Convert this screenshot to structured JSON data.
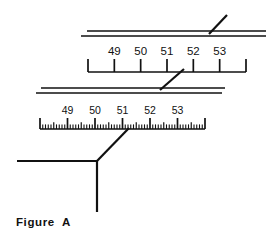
{
  "figure": {
    "caption": "Figure  A",
    "title": "Figure A",
    "ink_color": "#111111",
    "background_color": "#ffffff"
  },
  "chart_data": {
    "type": "diagram",
    "title": "Figure A",
    "xlabel": "",
    "ylabel": "",
    "scales": [
      {
        "name": "top-scale",
        "role": "coarse",
        "tick_labels": [
          "49",
          "50",
          "51",
          "52",
          "53"
        ],
        "tick_count": 7,
        "labeled_tick_indices": [
          1,
          2,
          3,
          4,
          5
        ],
        "minor_divisions": 0,
        "x_start": 88,
        "x_end": 246,
        "baseline_y": 72,
        "tick_height": 13
      },
      {
        "name": "bottom-scale",
        "role": "fine",
        "tick_labels": [
          "49",
          "50",
          "51",
          "52",
          "53"
        ],
        "tick_count": 7,
        "labeled_tick_indices": [
          1,
          2,
          3,
          4,
          5
        ],
        "minor_divisions": 10,
        "x_start": 40,
        "x_end": 205,
        "baseline_y": 129,
        "tick_height": 11
      }
    ],
    "rails": [
      {
        "name": "top-rail-upper",
        "x1": 87,
        "x2": 266,
        "y": 31
      },
      {
        "name": "top-rail-lower",
        "x1": 81,
        "x2": 266,
        "y": 36
      },
      {
        "name": "middle-rail-upper",
        "x1": 41,
        "x2": 225,
        "y": 88
      },
      {
        "name": "middle-rail-lower",
        "x1": 36,
        "x2": 222,
        "y": 93
      }
    ],
    "leaders": [
      {
        "name": "top-leader",
        "x1": 209,
        "y1": 34,
        "x2": 227,
        "y2": 15
      },
      {
        "name": "middle-leader",
        "x1": 160,
        "y1": 90,
        "x2": 184,
        "y2": 69
      },
      {
        "name": "bottom-leader",
        "x1": 97,
        "y1": 161,
        "x2": 129,
        "y2": 128
      }
    ],
    "pointer": {
      "name": "callout-pointer",
      "horizontal": {
        "x1": 17,
        "y1": 161,
        "x2": 97,
        "y2": 161
      },
      "vertical": {
        "x1": 97,
        "y1": 161,
        "x2": 97,
        "y2": 212
      }
    },
    "grid": false,
    "legend": false
  }
}
